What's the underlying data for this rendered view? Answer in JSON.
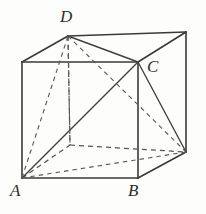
{
  "figure": {
    "kind": "geometry-diagram",
    "background_color": "#fdfdfb",
    "stroke_color": "#3a3a3a",
    "hidden_stroke_color": "#555555",
    "width": 206,
    "height": 214,
    "labels": [
      {
        "id": "A",
        "text": "A",
        "x": 10,
        "y": 182
      },
      {
        "id": "B",
        "text": "B",
        "x": 128,
        "y": 182
      },
      {
        "id": "C",
        "text": "C",
        "x": 147,
        "y": 58
      },
      {
        "id": "D",
        "text": "D",
        "x": 60,
        "y": 8
      }
    ],
    "vertices": {
      "front_top_left": {
        "x": 22,
        "y": 62
      },
      "front_top_right": {
        "x": 138,
        "y": 62
      },
      "front_bottom_left": {
        "x": 22,
        "y": 178
      },
      "front_bottom_right": {
        "x": 138,
        "y": 178
      },
      "back_top_left": {
        "x": 68,
        "y": 36
      },
      "back_top_right": {
        "x": 186,
        "y": 32
      },
      "back_bottom_left": {
        "x": 70,
        "y": 145
      },
      "back_bottom_right": {
        "x": 186,
        "y": 152
      }
    },
    "labelled_points": {
      "A": "front_bottom_left",
      "B": "front_bottom_right",
      "C": "front_top_right",
      "D": "back_top_left"
    }
  }
}
